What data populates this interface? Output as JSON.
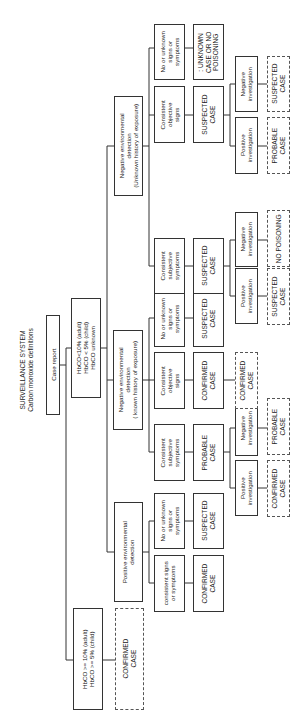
{
  "title": {
    "line1": "SURVEILLANCE SYSTEM",
    "line2": "Carbon monoxide definitions",
    "full": "SURVEILLANCE SYSTEM\nCarbon monoxide definitions"
  },
  "nodes": {
    "case_report": "Case report",
    "hbco_high": "HbCO >= 10% (adult)\nHbCO >= 5% (child)",
    "hbco_low": "HbCO<10% (adult)\nHbCO < 5% (child)\nHbCO unknown",
    "confirmed_direct": "CONFIRMED\nCASE",
    "pos_env": "Positive environmental\ndetection",
    "neg_env_known": "Negative environmental\ndetection\n( known history of exposure)",
    "neg_env_unknown": "Negative environmental\ndetection\n(Unknown history of exposure)",
    "pe_consistent": "consistent signs\nor symptoms",
    "pe_none": "No or unknown\nsigns or\nsymptoms",
    "pe_consistent_result": "CONFIRMED\nCASE",
    "pe_none_result": "SUSPECTED\nCASE",
    "nk_subjective": "Consistent\nsubjective\nsymptoms",
    "nk_objective": "Consistent\nobjective\nsigns",
    "nk_none": "No or unknown\nsigns or\nsymptoms",
    "nk_subjective_result": "PROBABLE\nCASE",
    "nk_objective_result": "CONFIRMED\nCASE",
    "nk_none_result": "SUSPECTED\nCASE",
    "nk_sub_pos_inv": "Positive\ninvestigation",
    "nk_sub_neg_inv": "Negative\ninvestigation",
    "nk_sub_pos_out": "CONFIRMED\nCASE",
    "nk_sub_neg_out": "PROBABLE\nCASE",
    "nk_obj_out": "CONFIRMED\nCASE",
    "nu_subjective": "Consistent\nsubjective\nsymptoms",
    "nu_objective": "Consistent\nobjective\nsigns",
    "nu_none": "No or unknown\nsigns or\nsymptoms",
    "nu_subjective_result": "SUSPECTED\nCASE",
    "nu_objective_result": "SUSPECTED\nCASE",
    "nu_none_result": ": UNKNOWN\nCASE OR NO\nPOISONING",
    "nu_sub_pos_inv": "Positive\ninvestigation",
    "nu_sub_neg_inv": "Negative\ninvestigation",
    "nu_sub_pos_out": "SUSPECTED\nCASE",
    "nu_sub_neg_out": "NO POISONING",
    "nu_obj_pos_inv": "Positive\ninvestigation",
    "nu_obj_neg_inv": "Negative\ninvestigation",
    "nu_obj_pos_out": "PROBABLE\nCASE",
    "nu_obj_neg_out": "SUSPECTED\nCASE"
  },
  "colors": {
    "line": "#333333",
    "background": "#ffffff",
    "text": "#222222"
  }
}
